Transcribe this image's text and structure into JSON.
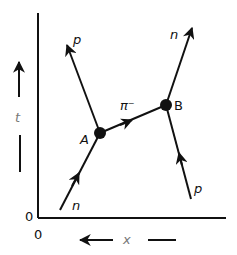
{
  "diagram": {
    "type": "spacetime-diagram",
    "axes": {
      "vertical_label": "t",
      "horizontal_label": "x",
      "vertical_origin": "0",
      "horizontal_origin": "0"
    },
    "vertices": [
      {
        "id": "A",
        "label": "A"
      },
      {
        "id": "B",
        "label": "B"
      }
    ],
    "lines": [
      {
        "particle": "n",
        "from": "bottom-left",
        "to": "A",
        "label": "n"
      },
      {
        "particle": "p",
        "from": "A",
        "to": "top-left",
        "label": "p"
      },
      {
        "particle": "pi-",
        "from": "A",
        "to": "B",
        "label": "π⁻"
      },
      {
        "particle": "n",
        "from": "B",
        "to": "top-right",
        "label": "n"
      },
      {
        "particle": "p",
        "from": "bottom-right",
        "to": "B",
        "label": "p"
      }
    ],
    "colors": {
      "ink": "#111111",
      "gray_label": "#777777",
      "background": "#ffffff"
    }
  }
}
